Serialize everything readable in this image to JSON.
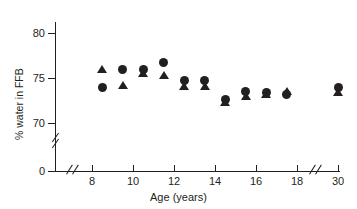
{
  "chart_data": {
    "type": "scatter",
    "title": "",
    "xlabel": "Age (years)",
    "ylabel": "% water in FFB",
    "xlim": [
      7.2,
      30
    ],
    "ylim": [
      69.0,
      81.0
    ],
    "grid": false,
    "legend_position": "none",
    "x_ticks": [
      "8",
      "10",
      "12",
      "14",
      "16",
      "18",
      "30"
    ],
    "x_tick_values": [
      8,
      10,
      12,
      14,
      16,
      18,
      30
    ],
    "y_ticks": [
      "80",
      "75",
      "70",
      "0"
    ],
    "y_tick_values": [
      80,
      75,
      70,
      0
    ],
    "y_axis_break": true,
    "x_axis_break": true,
    "series": [
      {
        "name": "circles",
        "marker": "circle",
        "color": "#231f20",
        "x": [
          8.5,
          9.5,
          10.5,
          11.5,
          12.5,
          13.5,
          14.5,
          15.5,
          16.5,
          17.5,
          30
        ],
        "y": [
          74.0,
          76.0,
          76.0,
          76.7,
          74.7,
          74.7,
          72.6,
          73.5,
          73.4,
          73.2,
          74.0
        ]
      },
      {
        "name": "triangles",
        "marker": "triangle",
        "color": "#231f20",
        "x": [
          8.5,
          9.5,
          10.5,
          11.5,
          12.5,
          13.5,
          14.5,
          15.5,
          16.5,
          17.5,
          30
        ],
        "y": [
          76.0,
          74.2,
          75.6,
          75.3,
          74.1,
          74.1,
          72.3,
          73.0,
          73.2,
          73.6,
          73.5
        ]
      }
    ]
  },
  "axes": {
    "y_label": "% water in FFB",
    "x_label": "Age (years)",
    "zero_label": "0"
  }
}
